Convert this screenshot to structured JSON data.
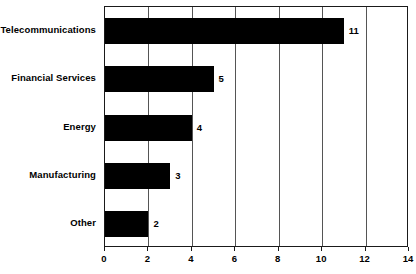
{
  "chart_data": {
    "type": "bar",
    "orientation": "horizontal",
    "title": "",
    "subtitle": "",
    "xlabel": "",
    "ylabel": "",
    "categories": [
      "Telecommunications",
      "Financial Services",
      "Energy",
      "Manufacturing",
      "Other"
    ],
    "values": [
      11,
      5,
      4,
      3,
      2
    ],
    "data_labels": [
      "11",
      "5",
      "4",
      "3",
      "2"
    ],
    "xlim": [
      0,
      14
    ],
    "xticks": [
      0,
      2,
      4,
      6,
      8,
      10,
      12,
      14
    ],
    "xtick_labels": [
      "0",
      "2",
      "4",
      "6",
      "8",
      "10",
      "12",
      "14"
    ],
    "grid": "vertical",
    "legend": "none",
    "bar_color": "#000000",
    "axis_color": "#1a1a1a",
    "gridline_color": "#555555",
    "background_color": "#ffffff"
  }
}
